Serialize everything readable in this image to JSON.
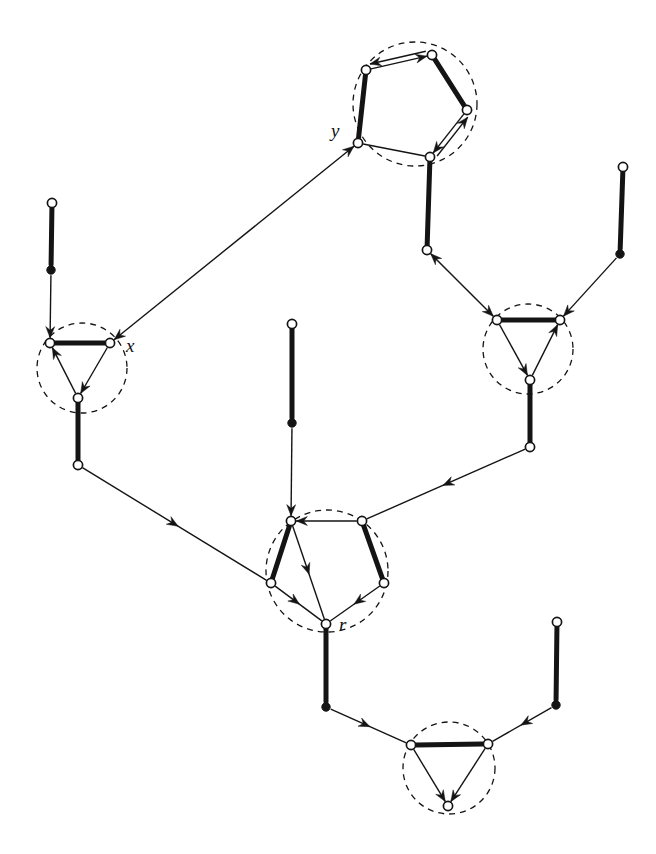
{
  "figure": {
    "width": 656,
    "height": 854,
    "background": "#ffffff",
    "ink_color": "#141414",
    "thick_edge_width": 5.0,
    "thin_edge_width": 1.4,
    "dashed_circle_width": 1.3,
    "dash_pattern": "6 5",
    "node_radius": 4.6,
    "filled_node_radius": 4.2
  },
  "labels": [
    {
      "id": "label-y",
      "text": "y",
      "x": 331,
      "y": 137
    },
    {
      "id": "label-x",
      "text": "x",
      "x": 126,
      "y": 352
    },
    {
      "id": "label-r",
      "text": "r",
      "x": 339,
      "y": 631
    }
  ],
  "clusters": [
    {
      "id": "cluster-top-pentagon",
      "cx": 415,
      "cy": 104,
      "r": 62,
      "shape": "pentagon"
    },
    {
      "id": "cluster-x-triangle",
      "cx": 82,
      "cy": 368,
      "r": 45,
      "shape": "triangle"
    },
    {
      "id": "cluster-right-triangle",
      "cx": 528,
      "cy": 349,
      "r": 45,
      "shape": "triangle"
    },
    {
      "id": "cluster-r-pentagon",
      "cx": 327,
      "cy": 571,
      "r": 61,
      "shape": "pentagon"
    },
    {
      "id": "cluster-bottom-triangle",
      "cx": 449,
      "cy": 768,
      "r": 46,
      "shape": "triangle"
    }
  ],
  "nodes": [
    {
      "id": "n-top-pent-upperleft",
      "x": 366,
      "y": 70,
      "kind": "open",
      "cluster": "cluster-top-pentagon"
    },
    {
      "id": "n-top-pent-top",
      "x": 432,
      "y": 55,
      "kind": "open",
      "cluster": "cluster-top-pentagon"
    },
    {
      "id": "n-top-pent-right",
      "x": 467,
      "y": 110,
      "kind": "open",
      "cluster": "cluster-top-pentagon"
    },
    {
      "id": "n-top-pent-lowerright",
      "x": 430,
      "y": 157,
      "kind": "open",
      "cluster": "cluster-top-pentagon"
    },
    {
      "id": "n-y",
      "x": 358,
      "y": 143,
      "kind": "open",
      "cluster": "cluster-top-pentagon"
    },
    {
      "id": "n-left-stem-top",
      "x": 52,
      "y": 203,
      "kind": "open",
      "cluster": null
    },
    {
      "id": "n-left-stem-dot",
      "x": 51,
      "y": 270,
      "kind": "filled",
      "cluster": null
    },
    {
      "id": "n-x-left",
      "x": 50,
      "y": 343,
      "kind": "open",
      "cluster": "cluster-x-triangle"
    },
    {
      "id": "n-x",
      "x": 110,
      "y": 343,
      "kind": "open",
      "cluster": "cluster-x-triangle"
    },
    {
      "id": "n-x-bottom",
      "x": 78,
      "y": 398,
      "kind": "open",
      "cluster": "cluster-x-triangle"
    },
    {
      "id": "n-x-stem-end",
      "x": 78,
      "y": 465,
      "kind": "open",
      "cluster": null
    },
    {
      "id": "n-mid-link-left",
      "x": 427,
      "y": 250,
      "kind": "open",
      "cluster": null
    },
    {
      "id": "n-right-stem-top",
      "x": 623,
      "y": 167,
      "kind": "open",
      "cluster": null
    },
    {
      "id": "n-right-stem-dot",
      "x": 620,
      "y": 254,
      "kind": "filled",
      "cluster": null
    },
    {
      "id": "n-rt-left",
      "x": 497,
      "y": 320,
      "kind": "open",
      "cluster": "cluster-right-triangle"
    },
    {
      "id": "n-rt-right",
      "x": 560,
      "y": 320,
      "kind": "open",
      "cluster": "cluster-right-triangle"
    },
    {
      "id": "n-rt-bottom",
      "x": 530,
      "y": 380,
      "kind": "open",
      "cluster": "cluster-right-triangle"
    },
    {
      "id": "n-rt-stem-end",
      "x": 530,
      "y": 447,
      "kind": "open",
      "cluster": null
    },
    {
      "id": "n-center-stem-top",
      "x": 292,
      "y": 324,
      "kind": "open",
      "cluster": null
    },
    {
      "id": "n-center-stem-dot",
      "x": 292,
      "y": 423,
      "kind": "filled",
      "cluster": null
    },
    {
      "id": "n-rp-topleft",
      "x": 291,
      "y": 521,
      "kind": "open",
      "cluster": "cluster-r-pentagon"
    },
    {
      "id": "n-rp-topright",
      "x": 362,
      "y": 521,
      "kind": "open",
      "cluster": "cluster-r-pentagon"
    },
    {
      "id": "n-rp-right",
      "x": 384,
      "y": 583,
      "kind": "open",
      "cluster": "cluster-r-pentagon"
    },
    {
      "id": "n-r",
      "x": 326,
      "y": 624,
      "kind": "open",
      "cluster": "cluster-r-pentagon"
    },
    {
      "id": "n-rp-left",
      "x": 271,
      "y": 583,
      "kind": "open",
      "cluster": "cluster-r-pentagon"
    },
    {
      "id": "n-r-stem-dot",
      "x": 326,
      "y": 707,
      "kind": "filled",
      "cluster": null
    },
    {
      "id": "n-bottom-right-stem-top",
      "x": 557,
      "y": 622,
      "kind": "open",
      "cluster": null
    },
    {
      "id": "n-bottom-right-stem-dot",
      "x": 556,
      "y": 705,
      "kind": "filled",
      "cluster": null
    },
    {
      "id": "n-bt-left",
      "x": 411,
      "y": 745,
      "kind": "open",
      "cluster": "cluster-bottom-triangle"
    },
    {
      "id": "n-bt-right",
      "x": 488,
      "y": 744,
      "kind": "open",
      "cluster": "cluster-bottom-triangle"
    },
    {
      "id": "n-bt-bottom",
      "x": 448,
      "y": 806,
      "kind": "open",
      "cluster": "cluster-bottom-triangle"
    }
  ],
  "edges": [
    {
      "id": "e-toppent-upperleft-top",
      "from": "n-top-pent-upperleft",
      "to": "n-top-pent-top",
      "weight": "thin",
      "arrow": "end"
    },
    {
      "id": "e-toppent-top-upperleft",
      "from": "n-top-pent-top",
      "to": "n-top-pent-upperleft",
      "weight": "thin",
      "arrow": "end",
      "offset": 5
    },
    {
      "id": "e-toppent-top-right",
      "from": "n-top-pent-top",
      "to": "n-top-pent-right",
      "weight": "thick",
      "arrow": "none"
    },
    {
      "id": "e-toppent-right-lowerright",
      "from": "n-top-pent-right",
      "to": "n-top-pent-lowerright",
      "weight": "thin",
      "arrow": "end"
    },
    {
      "id": "e-toppent-lowerright-right",
      "from": "n-top-pent-lowerright",
      "to": "n-top-pent-right",
      "weight": "thin",
      "arrow": "end",
      "offset": 5
    },
    {
      "id": "e-toppent-lowerright-y",
      "from": "n-top-pent-lowerright",
      "to": "n-y",
      "weight": "thin",
      "arrow": "none"
    },
    {
      "id": "e-toppent-y-upperleft",
      "from": "n-y",
      "to": "n-top-pent-upperleft",
      "weight": "thick",
      "arrow": "none"
    },
    {
      "id": "e-left-stem-thick",
      "from": "n-left-stem-top",
      "to": "n-left-stem-dot",
      "weight": "thick",
      "arrow": "none"
    },
    {
      "id": "e-left-stem-arrow",
      "from": "n-left-stem-dot",
      "to": "n-x-left",
      "weight": "thin",
      "arrow": "end"
    },
    {
      "id": "e-x-top",
      "from": "n-x-left",
      "to": "n-x",
      "weight": "thick",
      "arrow": "none"
    },
    {
      "id": "e-x-bottom-to-left",
      "from": "n-x-bottom",
      "to": "n-x-left",
      "weight": "thin",
      "arrow": "end"
    },
    {
      "id": "e-x-right-to-bottom",
      "from": "n-x",
      "to": "n-x-bottom",
      "weight": "thin",
      "arrow": "end"
    },
    {
      "id": "e-x-stem",
      "from": "n-x-bottom",
      "to": "n-x-stem-end",
      "weight": "thick",
      "arrow": "none"
    },
    {
      "id": "e-y-to-x",
      "from": "n-y",
      "to": "n-x",
      "weight": "thin",
      "arrow": "both"
    },
    {
      "id": "e-toppent-lowerright-midlink",
      "from": "n-top-pent-lowerright",
      "to": "n-mid-link-left",
      "weight": "thick",
      "arrow": "none"
    },
    {
      "id": "e-midlink-rt",
      "from": "n-mid-link-left",
      "to": "n-rt-left",
      "weight": "thin",
      "arrow": "both"
    },
    {
      "id": "e-right-stem-thick",
      "from": "n-right-stem-top",
      "to": "n-right-stem-dot",
      "weight": "thick",
      "arrow": "none"
    },
    {
      "id": "e-right-stem-arrow",
      "from": "n-right-stem-dot",
      "to": "n-rt-right",
      "weight": "thin",
      "arrow": "end"
    },
    {
      "id": "e-rt-top",
      "from": "n-rt-left",
      "to": "n-rt-right",
      "weight": "thick",
      "arrow": "none"
    },
    {
      "id": "e-rt-left-to-bottom",
      "from": "n-rt-left",
      "to": "n-rt-bottom",
      "weight": "thin",
      "arrow": "end"
    },
    {
      "id": "e-rt-bottom-to-right",
      "from": "n-rt-bottom",
      "to": "n-rt-right",
      "weight": "thin",
      "arrow": "end"
    },
    {
      "id": "e-rt-stem",
      "from": "n-rt-bottom",
      "to": "n-rt-stem-end",
      "weight": "thick",
      "arrow": "none"
    },
    {
      "id": "e-center-stem-thick",
      "from": "n-center-stem-top",
      "to": "n-center-stem-dot",
      "weight": "thick",
      "arrow": "none"
    },
    {
      "id": "e-center-stem-arrow",
      "from": "n-center-stem-dot",
      "to": "n-rp-topleft",
      "weight": "thin",
      "arrow": "end"
    },
    {
      "id": "e-xstem-to-rp-left",
      "from": "n-x-stem-end",
      "to": "n-rp-left",
      "weight": "thin",
      "arrow": "mid"
    },
    {
      "id": "e-rtstem-to-rp-topright",
      "from": "n-rt-stem-end",
      "to": "n-rp-topright",
      "weight": "thin",
      "arrow": "mid"
    },
    {
      "id": "e-rp-topright-topleft",
      "from": "n-rp-topright",
      "to": "n-rp-topleft",
      "weight": "thin",
      "arrow": "end"
    },
    {
      "id": "e-rp-topleft-left",
      "from": "n-rp-topleft",
      "to": "n-rp-left",
      "weight": "thick",
      "arrow": "none"
    },
    {
      "id": "e-rp-topright-right",
      "from": "n-rp-topright",
      "to": "n-rp-right",
      "weight": "thick",
      "arrow": "none"
    },
    {
      "id": "e-rp-topleft-r",
      "from": "n-rp-topleft",
      "to": "n-r",
      "weight": "thin",
      "arrow": "mid"
    },
    {
      "id": "e-rp-left-r",
      "from": "n-rp-left",
      "to": "n-r",
      "weight": "thin",
      "arrow": "mid"
    },
    {
      "id": "e-rp-right-r",
      "from": "n-rp-right",
      "to": "n-r",
      "weight": "thin",
      "arrow": "mid"
    },
    {
      "id": "e-r-stem",
      "from": "n-r",
      "to": "n-r-stem-dot",
      "weight": "thick",
      "arrow": "none"
    },
    {
      "id": "e-rdot-to-bt-left",
      "from": "n-r-stem-dot",
      "to": "n-bt-left",
      "weight": "thin",
      "arrow": "mid"
    },
    {
      "id": "e-bottom-right-stem-thick",
      "from": "n-bottom-right-stem-top",
      "to": "n-bottom-right-stem-dot",
      "weight": "thick",
      "arrow": "none"
    },
    {
      "id": "e-bottom-right-stem-arrow",
      "from": "n-bottom-right-stem-dot",
      "to": "n-bt-right",
      "weight": "thin",
      "arrow": "mid"
    },
    {
      "id": "e-bt-top",
      "from": "n-bt-left",
      "to": "n-bt-right",
      "weight": "thick",
      "arrow": "none"
    },
    {
      "id": "e-bt-left-to-bottom",
      "from": "n-bt-left",
      "to": "n-bt-bottom",
      "weight": "thin",
      "arrow": "end"
    },
    {
      "id": "e-bt-right-to-bottom",
      "from": "n-bt-right",
      "to": "n-bt-bottom",
      "weight": "thin",
      "arrow": "end"
    }
  ]
}
